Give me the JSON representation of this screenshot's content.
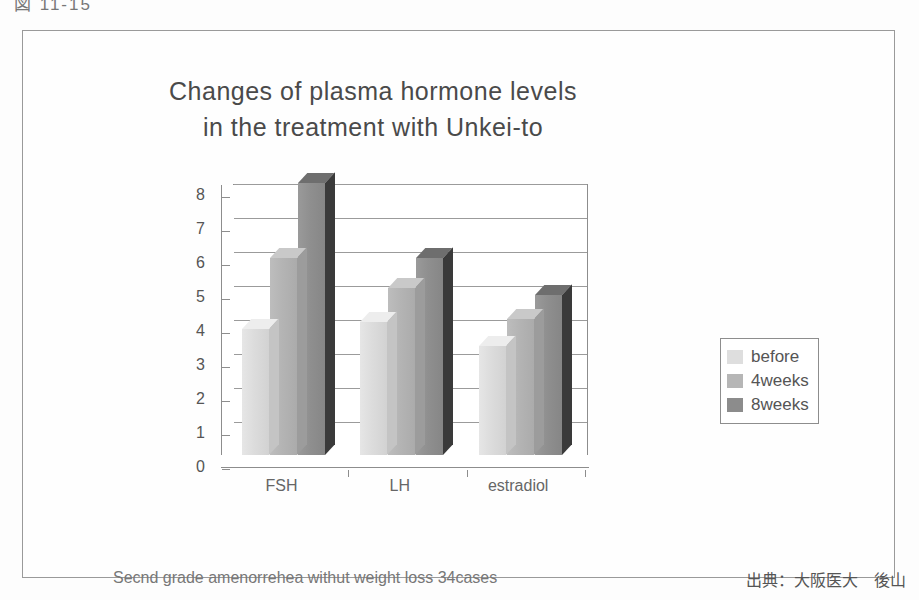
{
  "figure": {
    "caption_cut": "図 11-15",
    "footer_note": "Secnd grade amenorrehea withut weight loss 34cases",
    "source": "出典：大阪医大　後山"
  },
  "chart_data": {
    "type": "bar",
    "title": "Changes of plasma hormone levels",
    "subtitle": "in the treatment with Unkei-to",
    "categories": [
      "FSH",
      "LH",
      "estradiol"
    ],
    "series": [
      {
        "name": "before",
        "values": [
          3.7,
          3.9,
          3.2
        ],
        "color": "#dcdcdc"
      },
      {
        "name": "4weeks",
        "values": [
          5.8,
          4.9,
          4.0
        ],
        "color": "#b4b4b4"
      },
      {
        "name": "8weeks",
        "values": [
          8.0,
          5.8,
          4.7
        ],
        "color": "#8f8f8f"
      }
    ],
    "xlabel": "",
    "ylabel": "",
    "ylim": [
      0,
      8
    ],
    "yticks": [
      0,
      1,
      2,
      3,
      4,
      5,
      6,
      7,
      8
    ],
    "ytick_labels": [
      "0",
      "1",
      "2",
      "3",
      "4",
      "5",
      "6",
      "7",
      "8"
    ],
    "grid": true,
    "legend_position": "right",
    "style": "3d-column"
  }
}
